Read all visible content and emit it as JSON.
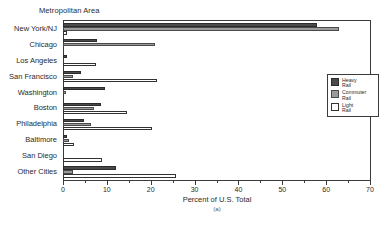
{
  "chart_data": {
    "type": "bar",
    "orientation": "horizontal",
    "title": "Metropolitan Area",
    "xlabel": "Percent of U.S. Total",
    "ylabel": "Metropolitan Area",
    "caption": "(a)",
    "xlim": [
      0,
      70
    ],
    "xticks": [
      0,
      10,
      20,
      30,
      40,
      50,
      60,
      70
    ],
    "xticklabels": [
      "0",
      "10",
      "20",
      "30",
      "40",
      "50",
      "60",
      "70"
    ],
    "grid": false,
    "legend_position": "right",
    "categories": [
      "New York/NJ",
      "Chicago",
      "Los Angeles",
      "San Francisco",
      "Washington",
      "Boston",
      "Philadelphia",
      "Baltimore",
      "San Diego",
      "Other Cities"
    ],
    "series": [
      {
        "name": "Heavy Rail",
        "color": "#4a4a4a",
        "values": [
          58.0,
          7.7,
          0.8,
          4.0,
          9.6,
          8.6,
          4.8,
          1.0,
          0.0,
          12.0
        ]
      },
      {
        "name": "Commuter Rail",
        "color": "#9a9a9a",
        "values": [
          63.0,
          21.0,
          0.0,
          2.2,
          0.6,
          7.0,
          6.3,
          1.4,
          0.0,
          2.3
        ]
      },
      {
        "name": "Light Rail",
        "color": "#ffffff",
        "values": [
          1.0,
          0.0,
          7.6,
          21.5,
          0.0,
          14.6,
          20.3,
          2.4,
          9.0,
          25.8
        ]
      }
    ]
  },
  "legend": {
    "items": [
      {
        "label": "Heavy\nRail"
      },
      {
        "label": "Commuter\nRail"
      },
      {
        "label": "Light\nRail"
      }
    ]
  }
}
